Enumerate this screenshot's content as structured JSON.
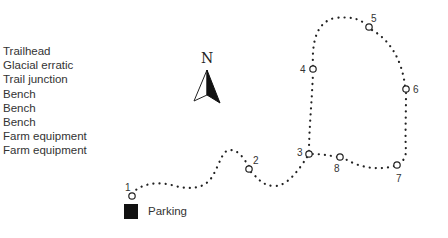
{
  "legend": {
    "items": [
      {
        "number": 1,
        "label": "Trailhead"
      },
      {
        "number": 2,
        "label": "Glacial erratic"
      },
      {
        "number": 3,
        "label": "Trail junction"
      },
      {
        "number": 4,
        "label": "Bench"
      },
      {
        "number": 5,
        "label": "Bench"
      },
      {
        "number": 6,
        "label": "Bench"
      },
      {
        "number": 7,
        "label": "Farm equipment"
      },
      {
        "number": 8,
        "label": "Farm equipment"
      }
    ]
  },
  "compass": {
    "label": "N",
    "icon": "north-arrow-icon"
  },
  "parking": {
    "label": "Parking",
    "icon": "parking-square-icon",
    "color": "#111111"
  },
  "waypoints": [
    {
      "id": "1",
      "x": 132,
      "y": 196,
      "label_x": 125,
      "label_y": 190
    },
    {
      "id": "2",
      "x": 249,
      "y": 169,
      "label_x": 253,
      "label_y": 163
    },
    {
      "id": "3",
      "x": 309,
      "y": 154,
      "label_x": 297,
      "label_y": 155
    },
    {
      "id": "4",
      "x": 313,
      "y": 69,
      "label_x": 300,
      "label_y": 73
    },
    {
      "id": "5",
      "x": 369,
      "y": 27,
      "label_x": 371,
      "label_y": 22
    },
    {
      "id": "6",
      "x": 406,
      "y": 89,
      "label_x": 414,
      "label_y": 93
    },
    {
      "id": "7",
      "x": 397,
      "y": 165,
      "label_x": 396,
      "label_y": 181
    },
    {
      "id": "8",
      "x": 340,
      "y": 157,
      "label_x": 334,
      "label_y": 172
    }
  ],
  "colors": {
    "trail": "#222222",
    "text": "#333333"
  }
}
